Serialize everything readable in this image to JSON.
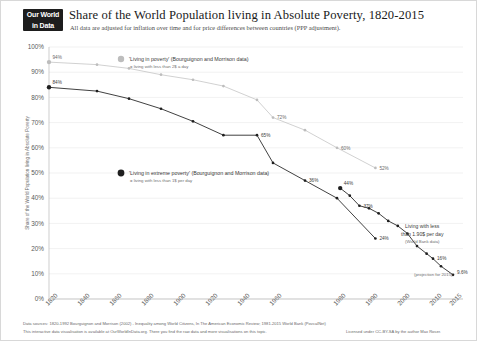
{
  "header": {
    "logo_line1": "Our World",
    "logo_line2": "in Data",
    "title": "Share of the World Population living in Absolute Poverty, 1820-2015",
    "subtitle": "All data are adjusted for inflation over time and for price differences between countries (PPP adjustment)."
  },
  "legend": {
    "poverty": {
      "title": "'Living in poverty' (Bourguignon and Morrison data)",
      "sub": "= living with less than 2$ a day",
      "color": "#bdbdbd"
    },
    "extreme": {
      "title": "'Living in extreme poverty' (Bourguignon and Morrison data)",
      "sub": "= living with less than 1$ per day",
      "color": "#1f1f1f"
    }
  },
  "annotations": {
    "worldbank_line1": "Living with less",
    "worldbank_line2": "than 1.90$ per day",
    "worldbank_line3": "(World Bank data)",
    "projection": "(projection for 2015)"
  },
  "footer": {
    "line1": "Data sources: 1820-1992 Bourguignon and Morrison (2002) - Inequality among World Citizens, In The American Economic Review; 1981-2015 World Bank (PovcalNet)",
    "line2": "This interactive data visualisation is available at OurWorldInData.org. There you find the raw data and more visualisations on this topic.",
    "line3": "Licensed under CC-BY-SA by the author Max Roser."
  },
  "chart_data": {
    "type": "line",
    "title": "Share of the World Population living in Absolute Poverty, 1820-2015",
    "subtitle": "All data are adjusted for inflation over time and for price differences between countries (PPP adjustment).",
    "xlabel": "",
    "ylabel": "Share of the World Population living in Absolute Poverty",
    "ylim": [
      0,
      100
    ],
    "xlim": [
      1820,
      2015
    ],
    "grid": true,
    "legend_position": "inside",
    "y_ticks": [
      "0%",
      "10%",
      "20%",
      "30%",
      "40%",
      "50%",
      "60%",
      "70%",
      "80%",
      "90%",
      "100%"
    ],
    "y_tick_values": [
      0,
      10,
      20,
      30,
      40,
      50,
      60,
      70,
      80,
      90,
      100
    ],
    "x_ticks": [
      "1820",
      "1840",
      "1860",
      "1880",
      "1900",
      "1920",
      "1940",
      "1960",
      "1980",
      "1990",
      "2000",
      "2010",
      "2015"
    ],
    "x_tick_values": [
      1820,
      1840,
      1860,
      1880,
      1900,
      1920,
      1940,
      1960,
      1980,
      1990,
      2000,
      2010,
      2015
    ],
    "series": [
      {
        "name": "'Living in poverty' (Bourguignon and Morrison data)",
        "note": "living with less than 2$ a day",
        "color": "#bdbdbd",
        "x": [
          1820,
          1850,
          1870,
          1890,
          1910,
          1929,
          1950,
          1960,
          1970,
          1980,
          1992
        ],
        "values": [
          94,
          93,
          91.5,
          89,
          87,
          84.5,
          79,
          72,
          67,
          60,
          52
        ],
        "point_labels": {
          "1820": "94%",
          "1960": "72%",
          "1980": "60%",
          "1992": "52%"
        }
      },
      {
        "name": "'Living in extreme poverty' (Bourguignon and Morrison data)",
        "note": "living with less than 1$ per day",
        "color": "#1f1f1f",
        "x": [
          1820,
          1850,
          1870,
          1890,
          1910,
          1929,
          1950,
          1960,
          1970,
          1980,
          1992
        ],
        "values": [
          84,
          82.5,
          79.5,
          75.5,
          70.5,
          65,
          65,
          54,
          47,
          40,
          24
        ],
        "point_labels": {
          "1820": "84%",
          "1950": "65%",
          "1970": "36%",
          "1992": "24%"
        }
      },
      {
        "name": "Living with less than 1.90$ per day (World Bank data)",
        "note": "World Bank data",
        "color": "#1f1f1f",
        "x": [
          1981,
          1984,
          1987,
          1990,
          1993,
          1996,
          1999,
          2002,
          2005,
          2008,
          2010,
          2012,
          2015
        ],
        "values": [
          44,
          41,
          37,
          36,
          34,
          31,
          29,
          26,
          21,
          18,
          16,
          13,
          9.6
        ],
        "point_labels": {
          "1981": "44%",
          "1987": "37%",
          "2010": "16%",
          "2015": "9.6%"
        }
      }
    ]
  }
}
